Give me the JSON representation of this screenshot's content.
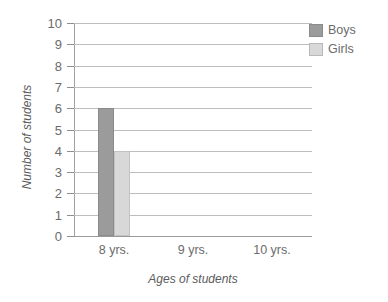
{
  "chart_data": {
    "type": "bar",
    "title": "",
    "xlabel": "Ages of students",
    "ylabel": "Number of students",
    "categories": [
      "8 yrs.",
      "9 yrs.",
      "10 yrs."
    ],
    "series": [
      {
        "name": "Boys",
        "values": [
          6,
          0,
          0
        ],
        "color": "#9b9b9b"
      },
      {
        "name": "Girls",
        "values": [
          4,
          0,
          0
        ],
        "color": "#d8d8d8"
      }
    ],
    "ylim": [
      0,
      10
    ],
    "ytick_labels": [
      "10",
      "9",
      "8",
      "7",
      "6",
      "5",
      "4",
      "3",
      "2",
      "1",
      "0"
    ],
    "ytick_values": [
      10,
      9,
      8,
      7,
      6,
      5,
      4,
      3,
      2,
      1,
      0
    ],
    "grid": true,
    "legend_position": "top-right"
  },
  "legend": {
    "entries": [
      {
        "label": "Boys",
        "color": "#9b9b9b"
      },
      {
        "label": "Girls",
        "color": "#d8d8d8"
      }
    ]
  },
  "axes": {
    "x_title": "Ages of students",
    "y_title": "Number of students"
  }
}
